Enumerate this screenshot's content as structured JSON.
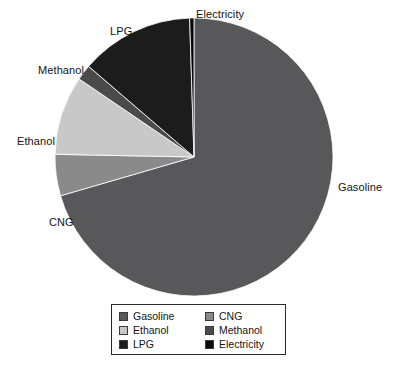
{
  "chart_data": {
    "type": "pie",
    "title": "",
    "subtitle": "",
    "xlabel": "",
    "ylabel": "",
    "legend_position": "bottom",
    "grid": false,
    "start_angle_deg": 0,
    "direction": "clockwise",
    "categories": [
      "Gasoline",
      "CNG",
      "Ethanol",
      "Methanol",
      "LPG",
      "Electricity"
    ],
    "values": [
      70.5,
      4.8,
      9.2,
      1.8,
      13.2,
      0.5
    ],
    "unit": "percent",
    "slices": [
      {
        "label": "Gasoline",
        "value": 70.5,
        "color": "#58585a",
        "start_deg": 0,
        "end_deg": 253.8,
        "callout": "Gasoline"
      },
      {
        "label": "CNG",
        "value": 4.8,
        "color": "#8a8a8a",
        "start_deg": 253.8,
        "end_deg": 271.1,
        "callout": "CNG"
      },
      {
        "label": "Ethanol",
        "value": 9.2,
        "color": "#c8c8c8",
        "start_deg": 271.1,
        "end_deg": 304.2,
        "callout": "Ethanol"
      },
      {
        "label": "Methanol",
        "value": 1.8,
        "color": "#4a4a4a",
        "start_deg": 304.2,
        "end_deg": 310.7,
        "callout": "Methanol"
      },
      {
        "label": "LPG",
        "value": 13.2,
        "color": "#1c1c1c",
        "start_deg": 310.7,
        "end_deg": 358.2,
        "callout": "LPG"
      },
      {
        "label": "Electricity",
        "value": 0.5,
        "color": "#0a0a0a",
        "start_deg": 358.2,
        "end_deg": 360.0,
        "callout": "Electricity"
      }
    ],
    "geometry": {
      "center_x": 194,
      "center_y": 157,
      "radius": 139
    }
  },
  "callouts": {
    "gasoline": "Gasoline",
    "cng": "CNG",
    "ethanol": "Ethanol",
    "methanol": "Methanol",
    "lpg": "LPG",
    "electricity": "Electricity"
  },
  "legend": {
    "entries": [
      {
        "label": "Gasoline",
        "color": "#58585a"
      },
      {
        "label": "CNG",
        "color": "#8a8a8a"
      },
      {
        "label": "Ethanol",
        "color": "#c8c8c8"
      },
      {
        "label": "Methanol",
        "color": "#4a4a4a"
      },
      {
        "label": "LPG",
        "color": "#1c1c1c"
      },
      {
        "label": "Electricity",
        "color": "#0a0a0a"
      }
    ],
    "border_color": "#2b2b2b",
    "background": "#ffffff"
  },
  "colors": {
    "page_background": "#ffffff",
    "text": "#141414"
  }
}
